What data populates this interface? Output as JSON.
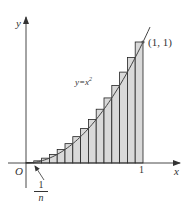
{
  "figure": {
    "type": "riemann-sum-diagram",
    "axes": {
      "x_label": "x",
      "y_label": "y",
      "origin_label": "O",
      "x_tick_label": "1"
    },
    "curve": {
      "label_prefix": "y=x",
      "label_exponent": "2",
      "function": "x^2"
    },
    "point_label": "(1, 1)",
    "width_label": {
      "numerator": "1",
      "denominator": "n"
    },
    "rectangles": {
      "count": 15,
      "type": "upper",
      "fill_color": "#d9d9d9",
      "stroke_color": "#222222"
    },
    "colors": {
      "axis": "#333333",
      "curve": "#444444",
      "background": "#ffffff"
    }
  }
}
